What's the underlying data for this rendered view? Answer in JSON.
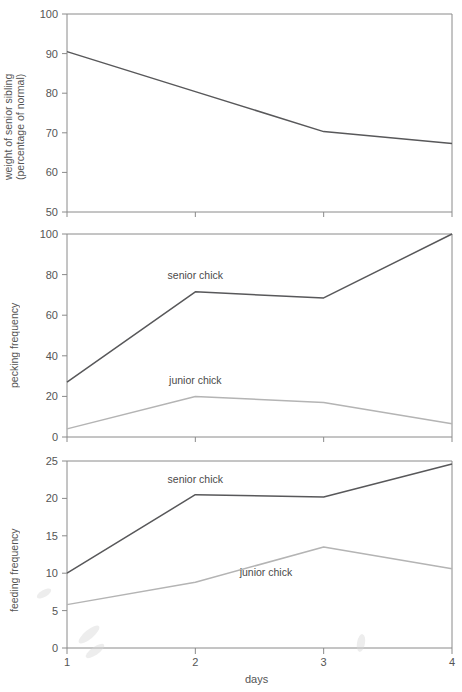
{
  "figure": {
    "background": "#ffffff",
    "axis_color": "#8a8a8a",
    "senior_color": "#58585a",
    "junior_color": "#b4b4b4",
    "xlabel": "days",
    "x_categories": [
      "1",
      "2",
      "3",
      "4"
    ],
    "x_values": [
      1,
      2,
      3,
      4
    ]
  },
  "chart_data": [
    {
      "type": "line",
      "title": "",
      "ylabel_line1": "weight of senior sibling",
      "ylabel_line2": "(percentage of normal)",
      "xlabel": "",
      "x": [
        1,
        2,
        3,
        4
      ],
      "xticklabels": [
        "1",
        "2",
        "3",
        "4"
      ],
      "yticks": [
        50,
        60,
        70,
        80,
        90,
        100
      ],
      "yticklabels": [
        "50",
        "60",
        "70",
        "80",
        "90",
        "100"
      ],
      "ylim": [
        50,
        100
      ],
      "xlim": [
        1,
        4
      ],
      "grid": false,
      "legend": "none",
      "series": [
        {
          "name": "weight of senior sibling",
          "color": "#58585a",
          "values": [
            90.5,
            80.4,
            70.3,
            67.3
          ]
        }
      ]
    },
    {
      "type": "line",
      "title": "",
      "ylabel_line1": "pecking frequency",
      "ylabel_line2": "",
      "xlabel": "",
      "x": [
        1,
        2,
        3,
        4
      ],
      "xticklabels": [
        "1",
        "2",
        "3",
        "4"
      ],
      "yticks": [
        0,
        20,
        40,
        60,
        80,
        100
      ],
      "yticklabels": [
        "0",
        "20",
        "40",
        "60",
        "80",
        "100"
      ],
      "ylim": [
        0,
        100
      ],
      "xlim": [
        1,
        4
      ],
      "grid": false,
      "legend": "inline-annotations",
      "series": [
        {
          "name": "senior chick",
          "color": "#58585a",
          "values": [
            27,
            71.5,
            68.5,
            100
          ]
        },
        {
          "name": "junior chick",
          "color": "#b4b4b4",
          "values": [
            4,
            20,
            17,
            6.5
          ]
        }
      ],
      "annotations": [
        {
          "text": "senior chick",
          "x": 2.0,
          "y": 78
        },
        {
          "text": "junior chick",
          "x": 2.0,
          "y": 26
        }
      ]
    },
    {
      "type": "line",
      "title": "",
      "ylabel_line1": "feeding frequency",
      "ylabel_line2": "",
      "xlabel": "days",
      "x": [
        1,
        2,
        3,
        4
      ],
      "xticklabels": [
        "1",
        "2",
        "3",
        "4"
      ],
      "yticks": [
        0,
        5,
        10,
        15,
        20,
        25
      ],
      "yticklabels": [
        "0",
        "5",
        "10",
        "15",
        "20",
        "25"
      ],
      "ylim": [
        0,
        25
      ],
      "xlim": [
        1,
        4
      ],
      "grid": false,
      "legend": "inline-annotations",
      "series": [
        {
          "name": "senior chick",
          "color": "#58585a",
          "values": [
            10.0,
            20.5,
            20.2,
            24.6
          ]
        },
        {
          "name": "junior chick",
          "color": "#b4b4b4",
          "values": [
            5.8,
            8.8,
            13.5,
            10.6
          ]
        }
      ],
      "annotations": [
        {
          "text": "senior chick",
          "x": 2.0,
          "y": 22.1
        },
        {
          "text": "junior chick",
          "x": 2.55,
          "y": 9.6
        }
      ]
    }
  ]
}
